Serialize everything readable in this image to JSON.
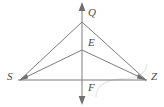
{
  "diagram": {
    "type": "geometry-figure",
    "colors": {
      "line": "#7d7d7d",
      "label": "#4a4a4a",
      "background": "#ffffff",
      "watermark": "#e8e8e8"
    },
    "points": [
      {
        "name": "Q",
        "label": "Q",
        "x": 82,
        "y": 22,
        "label_x": 88,
        "label_y": 7
      },
      {
        "name": "E",
        "label": "E",
        "x": 82,
        "y": 50,
        "label_x": 88,
        "label_y": 37
      },
      {
        "name": "S",
        "label": "S",
        "x": 20,
        "y": 80,
        "label_x": 7,
        "label_y": 71
      },
      {
        "name": "Z",
        "label": "Z",
        "x": 146,
        "y": 80,
        "label_x": 151,
        "label_y": 71
      },
      {
        "name": "F",
        "label": "F",
        "x": 82,
        "y": 80,
        "label_x": 88,
        "label_y": 82
      }
    ],
    "segments": [
      {
        "name": "segment-SQ",
        "from": "S",
        "to": "Q"
      },
      {
        "name": "segment-QZ",
        "from": "Q",
        "to": "Z"
      },
      {
        "name": "segment-SE",
        "from": "S",
        "to": "E"
      },
      {
        "name": "segment-EZ",
        "from": "E",
        "to": "Z"
      },
      {
        "name": "segment-SZ",
        "from": "S",
        "to": "Z"
      }
    ],
    "rays": [
      {
        "name": "vertical-line-QF",
        "x": 82,
        "y_top": 3,
        "y_bottom": 103,
        "arrow_top": true,
        "arrow_bottom": true
      }
    ]
  }
}
